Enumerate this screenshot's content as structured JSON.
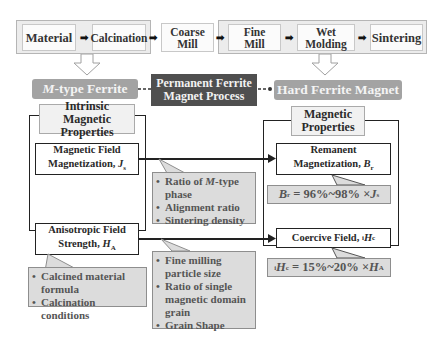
{
  "process_flow": {
    "steps": [
      {
        "label": "Material"
      },
      {
        "label": "Calcination"
      },
      {
        "label": "Coarse Mill"
      },
      {
        "label": "Fine Mill"
      },
      {
        "label": "Wet Molding"
      },
      {
        "label": "Sintering"
      }
    ],
    "arrow_glyph": "➡",
    "down_arrow_glyph": "⇩"
  },
  "center": {
    "left_node": "M-type Ferrite",
    "left_node_italic": "M",
    "left_node_rest": "-type Ferrite",
    "process_title_line1": "Permanent Ferrite",
    "process_title_line2": "Magnet Process",
    "right_node": "Hard Ferrite Magnet"
  },
  "intrinsic": {
    "title_line1": "Intrinsic Magnetic",
    "title_line2": "Properties",
    "magnetization_line1": "Magnetic Field",
    "magnetization_line2": "Magnetization, ",
    "magnetization_symbol": "J",
    "magnetization_sub": "s",
    "anisotropy_line1": "Anisotropic Field",
    "anisotropy_line2": "Strength, ",
    "anisotropy_symbol": "H",
    "anisotropy_sub": "A",
    "anisotropy_notes": [
      "Calcined material formula",
      "Calcination conditions"
    ]
  },
  "factors": {
    "remanence_notes": [
      "Ratio of M-type phase",
      "Alignment ratio",
      "Sintering density"
    ],
    "coercivity_notes": [
      "Fine milling particle size",
      "Ratio of single magnetic domain grain",
      "Grain Shape"
    ]
  },
  "magnetic": {
    "title_line1": "Magnetic",
    "title_line2": "Properties",
    "remanence_line1": "Remanent",
    "remanence_line2": "Magnetization, ",
    "remanence_symbol": "B",
    "remanence_sub": "r",
    "remanence_formula": "Br = 96%~98% ×Js",
    "formula_mid_1": " = 96%~98% ×",
    "coercive_label": "Coercive Field, ",
    "coercive_symbol": "H",
    "coercive_pre": "i",
    "coercive_sub": "c",
    "coercive_formula": "iHc = 15%~20% ×HA",
    "formula_mid_2": " = 15%~20% ×"
  },
  "colors": {
    "dark_box": "#4f4f4f",
    "pill": "#a3a3a3",
    "note_fill": "#dcdcdc",
    "group_fill": "#ececec"
  }
}
